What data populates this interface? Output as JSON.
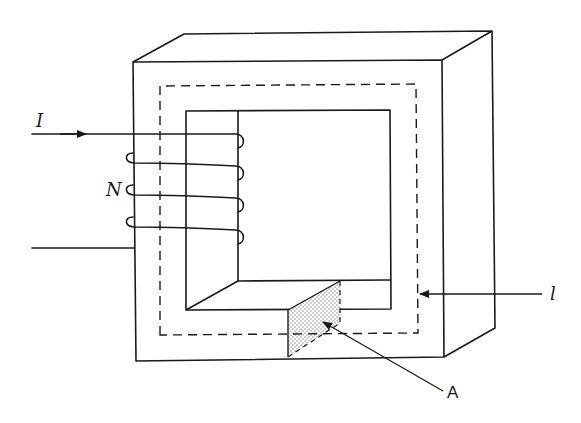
{
  "figure": {
    "labels": {
      "current": "I",
      "turns": "N",
      "path_length": "l",
      "area": "A"
    },
    "colors": {
      "line": "#1a1a1a",
      "background": "#ffffff",
      "shading": "#9a9a9a"
    }
  }
}
